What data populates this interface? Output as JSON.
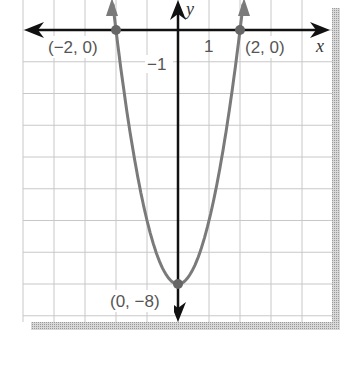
{
  "chart_data": {
    "type": "line",
    "title": "",
    "function": "y = 2x^2 - 8",
    "xlabel": "x",
    "ylabel": "y",
    "xlim": [
      -5,
      5
    ],
    "ylim": [
      -9.5,
      1
    ],
    "grid": true,
    "tick_labels": {
      "x": [
        "1"
      ],
      "y": [
        "-1"
      ]
    },
    "series": [
      {
        "name": "parabola",
        "color": "#777777",
        "points": [
          [
            -2.12,
            1
          ],
          [
            -2,
            0
          ],
          [
            -1.5,
            -3.5
          ],
          [
            -1,
            -6
          ],
          [
            -0.5,
            -7.5
          ],
          [
            0,
            -8
          ],
          [
            0.5,
            -7.5
          ],
          [
            1,
            -6
          ],
          [
            1.5,
            -3.5
          ],
          [
            2,
            0
          ],
          [
            2.12,
            1
          ]
        ]
      }
    ],
    "annotations": [
      {
        "text": "(−2, 0)",
        "point": [
          -2,
          0
        ]
      },
      {
        "text": "(2, 0)",
        "point": [
          2,
          0
        ]
      },
      {
        "text": "(0, −8)",
        "point": [
          0,
          -8
        ]
      }
    ]
  },
  "labels": {
    "x_axis": "x",
    "y_axis": "y",
    "tick_x1": "1",
    "tick_ym1": "−1",
    "pt_left": "(−2, 0)",
    "pt_right": "(2, 0)",
    "pt_vertex": "(0, −8)"
  }
}
